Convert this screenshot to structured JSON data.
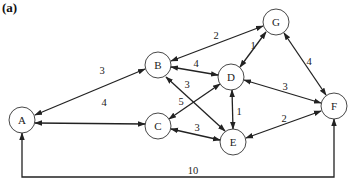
{
  "figure": {
    "label": "(a)"
  },
  "graph": {
    "directed": "bidirectional",
    "nodes": [
      {
        "id": "A",
        "label": "A",
        "x": 22,
        "y": 120
      },
      {
        "id": "B",
        "label": "B",
        "x": 158,
        "y": 65
      },
      {
        "id": "C",
        "label": "C",
        "x": 158,
        "y": 126
      },
      {
        "id": "D",
        "label": "D",
        "x": 231,
        "y": 77
      },
      {
        "id": "E",
        "label": "E",
        "x": 233,
        "y": 142
      },
      {
        "id": "F",
        "label": "F",
        "x": 334,
        "y": 106
      },
      {
        "id": "G",
        "label": "G",
        "x": 276,
        "y": 22
      }
    ],
    "edges": [
      {
        "from": "A",
        "to": "B",
        "weight": "3"
      },
      {
        "from": "A",
        "to": "C",
        "weight": "4"
      },
      {
        "from": "B",
        "to": "G",
        "weight": "2"
      },
      {
        "from": "B",
        "to": "D",
        "weight": "4"
      },
      {
        "from": "B",
        "to": "E",
        "weight": "3"
      },
      {
        "from": "C",
        "to": "D",
        "weight": "5"
      },
      {
        "from": "C",
        "to": "E",
        "weight": "3"
      },
      {
        "from": "D",
        "to": "G",
        "weight": "1"
      },
      {
        "from": "D",
        "to": "E",
        "weight": "1"
      },
      {
        "from": "D",
        "to": "F",
        "weight": "3"
      },
      {
        "from": "G",
        "to": "F",
        "weight": "4"
      },
      {
        "from": "E",
        "to": "F",
        "weight": "2"
      },
      {
        "from": "A",
        "to": "F",
        "weight": "10"
      }
    ]
  },
  "labels": {
    "w_AB": "3",
    "w_AC": "4",
    "w_BG": "2",
    "w_BD": "4",
    "w_BE": "3",
    "w_CD": "5",
    "w_CE": "3",
    "w_DG": "1",
    "w_DE": "1",
    "w_DF": "3",
    "w_GF": "4",
    "w_EF": "2",
    "w_AF": "10",
    "A": "A",
    "B": "B",
    "C": "C",
    "D": "D",
    "E": "E",
    "F": "F",
    "G": "G"
  }
}
